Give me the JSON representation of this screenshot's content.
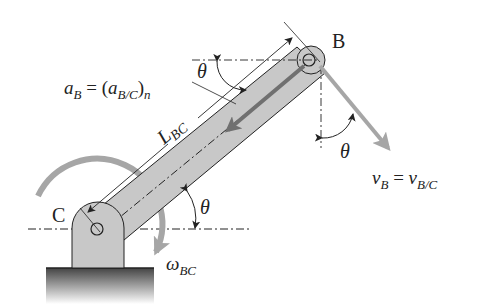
{
  "labels": {
    "point_b": "B",
    "point_c": "C",
    "accel_lhs": "a",
    "accel_lhs_sub": "B",
    "accel_eq": " = (",
    "accel_rhs": "a",
    "accel_rhs_sub": "B/C",
    "accel_close": ")",
    "accel_rhs_n": "n",
    "length": "L",
    "length_sub": "BC",
    "theta_top": "θ",
    "theta_right": "θ",
    "theta_bottom": "θ",
    "vel_lhs": "v",
    "vel_lhs_sub": "B",
    "vel_eq": " = ",
    "vel_rhs": "v",
    "vel_rhs_sub": "B/C",
    "omega": "ω",
    "omega_sub": "BC"
  },
  "colors": {
    "link_fill": "#c8c8c8",
    "arrow_gray": "#a6a6a6",
    "dark_arrow": "#707070",
    "line": "#222222",
    "ground": "#555555"
  }
}
